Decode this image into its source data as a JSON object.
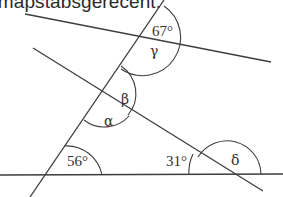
{
  "caption": "r mapstabsgerecent.",
  "angles": {
    "top": "67°",
    "gamma": "γ",
    "beta": "β",
    "alpha": "α",
    "bottom_left": "56°",
    "bottom_mid": "31°",
    "delta": "δ"
  },
  "colors": {
    "line": "#3d3d3d",
    "text": "#333333"
  }
}
